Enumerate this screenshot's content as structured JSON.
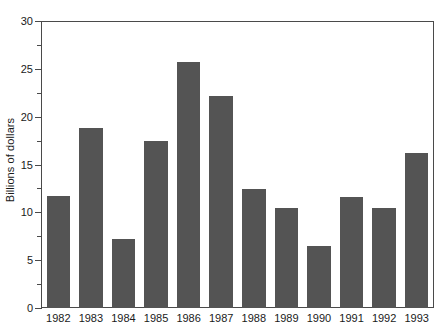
{
  "chart_data": {
    "type": "bar",
    "title": "",
    "xlabel": "",
    "ylabel": "Billions of dollars",
    "categories": [
      "1982",
      "1983",
      "1984",
      "1985",
      "1986",
      "1987",
      "1988",
      "1989",
      "1990",
      "1991",
      "1992",
      "1993"
    ],
    "values": [
      11.7,
      18.8,
      7.2,
      17.5,
      25.7,
      22.2,
      12.4,
      10.5,
      6.5,
      11.6,
      10.5,
      16.2
    ],
    "ylim": [
      0,
      30
    ],
    "ytick_major": [
      0,
      5,
      10,
      15,
      20,
      25,
      30
    ],
    "ytick_minor": [
      2.5,
      7.5,
      12.5,
      17.5,
      22.5,
      27.5
    ],
    "ytick_labels": [
      "0",
      "5",
      "10",
      "15",
      "20",
      "25",
      "30"
    ],
    "grid": false,
    "legend": null,
    "bar_color": "#545454",
    "axis_color": "#4a4a4a",
    "text_color": "#1a1a1a",
    "bar_width_fraction": 0.72
  }
}
